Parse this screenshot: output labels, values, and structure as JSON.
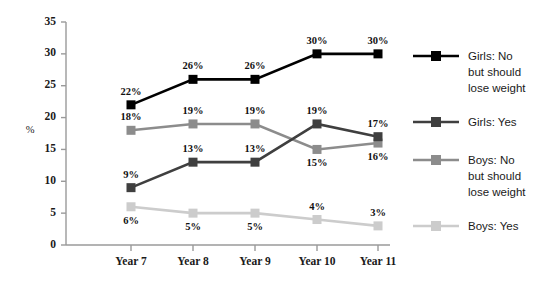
{
  "chart_data": {
    "type": "line",
    "title": "",
    "xlabel": "",
    "ylabel": "%",
    "categories": [
      "Year 7",
      "Year 8",
      "Year 9",
      "Year 10",
      "Year 11"
    ],
    "ylim": [
      0,
      35
    ],
    "yticks": [
      0,
      5,
      10,
      15,
      20,
      25,
      30,
      35
    ],
    "ytick_labels": [
      "0",
      "5",
      "10",
      "15",
      "20",
      "25",
      "30",
      "35"
    ],
    "grid": false,
    "legend_position": "right",
    "series": [
      {
        "name": "Girls: No but should lose weight",
        "legend_lines": [
          "Girls: No",
          "but should",
          "lose weight"
        ],
        "color": "#000000",
        "values": [
          22,
          26,
          26,
          30,
          30
        ],
        "data_labels": [
          "22%",
          "26%",
          "26%",
          "30%",
          "30%"
        ],
        "label_side": [
          "above",
          "above",
          "above",
          "above",
          "above"
        ]
      },
      {
        "name": "Girls: Yes",
        "legend_lines": [
          "Girls: Yes"
        ],
        "color": "#3f3f3f",
        "values": [
          9,
          13,
          13,
          19,
          17
        ],
        "data_labels": [
          "9%",
          "13%",
          "13%",
          "19%",
          "17%"
        ],
        "label_side": [
          "above",
          "above",
          "above",
          "above",
          "above"
        ]
      },
      {
        "name": "Boys: No but should lose weight",
        "legend_lines": [
          "Boys: No",
          "but should",
          "lose weight"
        ],
        "color": "#8c8c8c",
        "values": [
          18,
          19,
          19,
          15,
          16
        ],
        "data_labels": [
          "18%",
          "19%",
          "19%",
          "15%",
          "16%"
        ],
        "label_side": [
          "above",
          "above",
          "above",
          "below",
          "below"
        ]
      },
      {
        "name": "Boys: Yes",
        "legend_lines": [
          "Boys: Yes"
        ],
        "color": "#cccccc",
        "values": [
          6,
          5,
          5,
          4,
          3
        ],
        "data_labels": [
          "6%",
          "5%",
          "5%",
          "4%",
          "3%"
        ],
        "label_side": [
          "below",
          "below",
          "below",
          "above",
          "above"
        ]
      }
    ]
  },
  "axis": {
    "y_label": "%",
    "axis_color": "#9a9a9a"
  }
}
